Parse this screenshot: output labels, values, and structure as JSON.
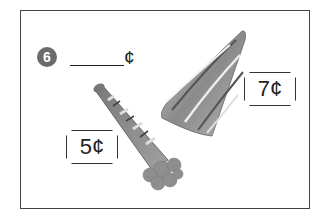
{
  "problem": {
    "number": "6",
    "answer_blank": "",
    "unit": "¢"
  },
  "items": [
    {
      "name": "party hat",
      "price": "7¢"
    },
    {
      "name": "party horn",
      "price": "5¢"
    }
  ],
  "colors": {
    "frame": "#444444",
    "badge": "#6b6b6b",
    "text": "#222222"
  }
}
